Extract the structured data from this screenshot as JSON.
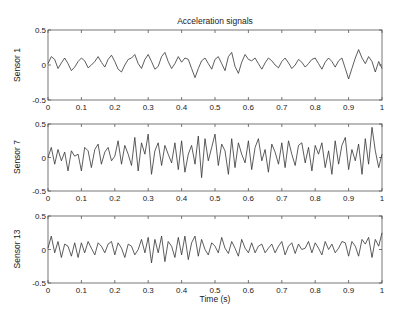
{
  "chart_data": [
    {
      "type": "line",
      "title": "Acceleration signals",
      "xlabel": "",
      "ylabel": "Sensor 1",
      "xlim": [
        0,
        1
      ],
      "ylim": [
        -0.5,
        0.5
      ],
      "xticks": [
        "0",
        "0.1",
        "0.2",
        "0.3",
        "0.4",
        "0.5",
        "0.6",
        "0.7",
        "0.8",
        "0.9",
        "1"
      ],
      "yticks": [
        "-0.5",
        "0",
        "0.5"
      ],
      "grid": false,
      "series": [
        {
          "name": "Sensor 1",
          "x_step": 0.01,
          "values": [
            0.02,
            0.12,
            0.08,
            -0.05,
            0.03,
            0.1,
            0.02,
            -0.08,
            -0.03,
            0.05,
            0.1,
            0.06,
            -0.04,
            0.0,
            0.05,
            0.12,
            0.04,
            -0.03,
            0.08,
            0.14,
            0.05,
            -0.06,
            -0.1,
            0.0,
            0.08,
            0.1,
            0.15,
            0.02,
            -0.05,
            0.08,
            0.15,
            0.05,
            -0.06,
            -0.02,
            0.12,
            0.18,
            0.05,
            -0.05,
            0.02,
            0.12,
            0.04,
            0.1,
            0.08,
            -0.05,
            -0.18,
            -0.05,
            0.06,
            0.1,
            0.02,
            -0.06,
            0.08,
            0.12,
            0.02,
            -0.08,
            0.12,
            0.18,
            -0.02,
            -0.12,
            0.04,
            0.15,
            0.08,
            0.06,
            0.1,
            0.02,
            -0.06,
            0.03,
            0.1,
            0.06,
            0.0,
            -0.04,
            0.05,
            0.1,
            0.03,
            -0.05,
            0.0,
            0.08,
            0.04,
            -0.03,
            0.02,
            0.08,
            0.1,
            0.02,
            -0.06,
            0.04,
            0.1,
            0.05,
            -0.03,
            0.06,
            0.1,
            -0.05,
            -0.2,
            -0.05,
            0.1,
            0.22,
            0.1,
            0.02,
            0.12,
            0.05,
            -0.1,
            0.05,
            -0.05
          ]
        }
      ]
    },
    {
      "type": "line",
      "title": "",
      "xlabel": "",
      "ylabel": "Sensor 7",
      "xlim": [
        0,
        1
      ],
      "ylim": [
        -0.5,
        0.5
      ],
      "xticks": [
        "0",
        "0.1",
        "0.2",
        "0.3",
        "0.4",
        "0.5",
        "0.6",
        "0.7",
        "0.8",
        "0.9",
        "1"
      ],
      "yticks": [
        "-0.5",
        "0",
        "0.5"
      ],
      "grid": false,
      "series": [
        {
          "name": "Sensor 7",
          "x_step": 0.01,
          "values": [
            0.0,
            0.15,
            -0.1,
            0.12,
            -0.05,
            0.08,
            -0.2,
            0.1,
            0.02,
            0.05,
            -0.2,
            0.15,
            0.1,
            -0.15,
            0.12,
            0.2,
            -0.1,
            0.08,
            0.15,
            -0.05,
            0.02,
            0.25,
            -0.1,
            0.18,
            0.05,
            -0.12,
            0.3,
            -0.2,
            0.22,
            0.05,
            0.35,
            -0.25,
            0.1,
            0.22,
            -0.12,
            0.18,
            0.05,
            -0.08,
            0.22,
            -0.18,
            0.25,
            -0.22,
            0.05,
            0.18,
            -0.1,
            0.32,
            -0.3,
            0.28,
            -0.05,
            0.15,
            0.35,
            -0.12,
            0.2,
            0.1,
            -0.25,
            0.28,
            -0.15,
            0.22,
            0.05,
            -0.08,
            0.25,
            -0.18,
            0.15,
            0.28,
            -0.05,
            0.12,
            -0.22,
            0.2,
            0.08,
            -0.1,
            0.22,
            -0.15,
            0.25,
            0.05,
            -0.12,
            0.18,
            0.22,
            -0.08,
            0.15,
            -0.2,
            0.18,
            0.05,
            0.22,
            -0.15,
            0.1,
            -0.25,
            0.25,
            -0.1,
            0.18,
            0.3,
            -0.18,
            0.12,
            -0.05,
            0.2,
            -0.25,
            0.28,
            -0.1,
            0.45,
            0.1,
            -0.15,
            0.05
          ]
        }
      ]
    },
    {
      "type": "line",
      "title": "",
      "xlabel": "Time (s)",
      "ylabel": "Sensor 13",
      "xlim": [
        0,
        1
      ],
      "ylim": [
        -0.5,
        0.5
      ],
      "xticks": [
        "0",
        "0.1",
        "0.2",
        "0.3",
        "0.4",
        "0.5",
        "0.6",
        "0.7",
        "0.8",
        "0.9",
        "1"
      ],
      "yticks": [
        "-0.5",
        "0",
        "0.5"
      ],
      "grid": false,
      "series": [
        {
          "name": "Sensor 13",
          "x_step": 0.01,
          "values": [
            0.02,
            0.2,
            -0.05,
            0.12,
            -0.12,
            0.08,
            0.05,
            -0.1,
            0.1,
            -0.12,
            0.1,
            -0.05,
            0.12,
            0.02,
            -0.08,
            0.1,
            0.05,
            -0.05,
            0.08,
            0.12,
            -0.08,
            0.1,
            0.02,
            -0.12,
            0.08,
            0.05,
            -0.08,
            0.0,
            0.15,
            -0.05,
            0.18,
            -0.2,
            0.15,
            -0.05,
            0.2,
            -0.18,
            0.12,
            0.05,
            -0.12,
            0.18,
            -0.08,
            0.2,
            -0.15,
            0.1,
            0.2,
            -0.1,
            0.15,
            0.0,
            -0.08,
            0.1,
            0.05,
            -0.05,
            0.18,
            0.02,
            -0.06,
            0.12,
            0.02,
            -0.1,
            0.15,
            0.02,
            -0.05,
            0.1,
            -0.05,
            0.05,
            0.08,
            -0.05,
            0.02,
            0.08,
            -0.05,
            0.05,
            0.12,
            -0.08,
            0.05,
            0.1,
            -0.06,
            0.08,
            0.0,
            0.02,
            0.12,
            -0.05,
            0.1,
            0.02,
            -0.08,
            0.12,
            0.0,
            0.08,
            -0.05,
            0.02,
            0.12,
            0.1,
            -0.1,
            0.12,
            0.05,
            -0.1,
            0.15,
            0.08,
            0.18,
            -0.12,
            0.15,
            0.05,
            0.25
          ]
        }
      ]
    }
  ]
}
